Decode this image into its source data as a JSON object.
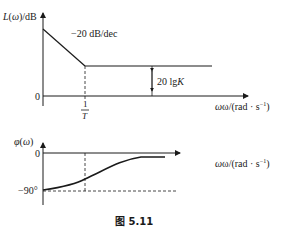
{
  "magnitude_plot": {
    "ylabel": "L(ω)/dB",
    "xlabel": "ω/(rad·s⁻¹)",
    "xlabel_main": "ω/(rad · s",
    "xlabel_exp": "−1",
    "xlabel_close": ")",
    "origin_label": "0",
    "slope_label": "−20 dB/dec",
    "gain_label": "20 lgK",
    "gain_label_main": "20 lg",
    "gain_label_var": "K",
    "corner_label_num": "1",
    "corner_label_den": "T"
  },
  "phase_plot": {
    "ylabel": "φ(ω)",
    "xlabel_main": "ω/(rad · s",
    "xlabel_exp": "−1",
    "xlabel_close": ")",
    "zero_label": "0",
    "min_label": "−90°"
  },
  "caption": "图 5.11"
}
